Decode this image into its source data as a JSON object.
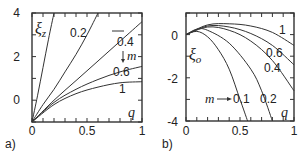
{
  "chart_data": [
    {
      "panel_label": "a)",
      "type": "line",
      "xlabel": "q",
      "ylabel": "ξz",
      "xlim": [
        0,
        1
      ],
      "ylim": [
        -1,
        4
      ],
      "x_ticks": [
        "0",
        "0.5",
        "1"
      ],
      "y_ticks": [
        "0",
        "2",
        "4"
      ],
      "parameter": "m",
      "parameter_annotation": "↓ m",
      "series": [
        {
          "name": "m=0.1",
          "label": "",
          "x": [
            0,
            0.05,
            0.1,
            0.15,
            0.2
          ],
          "y": [
            -1,
            0.2,
            1.5,
            2.8,
            4.0
          ]
        },
        {
          "name": "m=0.2",
          "label": "0.2",
          "x": [
            0,
            0.1,
            0.2,
            0.3,
            0.4,
            0.5,
            0.6
          ],
          "y": [
            -1,
            -0.2,
            0.5,
            1.3,
            2.1,
            3.0,
            4.0
          ]
        },
        {
          "name": "m=0.4",
          "label": "0.4",
          "x": [
            0,
            0.2,
            0.4,
            0.6,
            0.8,
            1.0
          ],
          "y": [
            -1,
            0.0,
            0.9,
            1.8,
            2.7,
            3.6
          ]
        },
        {
          "name": "m=0.6",
          "label": "0.6",
          "x": [
            0,
            0.2,
            0.4,
            0.6,
            0.8,
            1.0
          ],
          "y": [
            -1,
            -0.1,
            0.5,
            0.95,
            1.3,
            1.55
          ]
        },
        {
          "name": "m=1",
          "label": "1",
          "x": [
            0,
            0.2,
            0.4,
            0.6,
            0.8,
            1.0
          ],
          "y": [
            -1,
            -0.2,
            0.3,
            0.6,
            0.8,
            0.85
          ]
        }
      ]
    },
    {
      "panel_label": "b)",
      "type": "line",
      "xlabel": "q",
      "ylabel": "ξo",
      "xlim": [
        0,
        1
      ],
      "ylim": [
        -4,
        1
      ],
      "x_ticks": [
        "0",
        "0.5",
        "1"
      ],
      "y_ticks": [
        "0",
        "-2",
        "-4"
      ],
      "parameter": "m",
      "parameter_annotation": "m → 0.1",
      "series": [
        {
          "name": "m=0.1",
          "label": "0.1",
          "x": [
            0,
            0.1,
            0.2,
            0.3,
            0.4,
            0.5,
            0.57
          ],
          "y": [
            0,
            0.15,
            -0.1,
            -0.7,
            -1.6,
            -3.0,
            -4.0
          ]
        },
        {
          "name": "m=0.2",
          "label": "0.2",
          "x": [
            0,
            0.1,
            0.2,
            0.4,
            0.6,
            0.7,
            0.8
          ],
          "y": [
            0,
            0.25,
            0.2,
            -0.4,
            -1.6,
            -2.6,
            -4.0
          ]
        },
        {
          "name": "m=0.4",
          "label": "0.4",
          "x": [
            0,
            0.2,
            0.4,
            0.6,
            0.8,
            1.0
          ],
          "y": [
            0,
            0.35,
            0.2,
            -0.3,
            -1.2,
            -2.6
          ]
        },
        {
          "name": "m=0.6",
          "label": "0.6",
          "x": [
            0,
            0.2,
            0.4,
            0.6,
            0.8,
            1.0
          ],
          "y": [
            0,
            0.4,
            0.35,
            0.05,
            -0.5,
            -1.4
          ]
        },
        {
          "name": "m=1",
          "label": "1",
          "x": [
            0,
            0.2,
            0.4,
            0.6,
            0.8,
            1.0
          ],
          "y": [
            0,
            0.45,
            0.5,
            0.4,
            0.1,
            -0.5
          ]
        }
      ]
    }
  ]
}
